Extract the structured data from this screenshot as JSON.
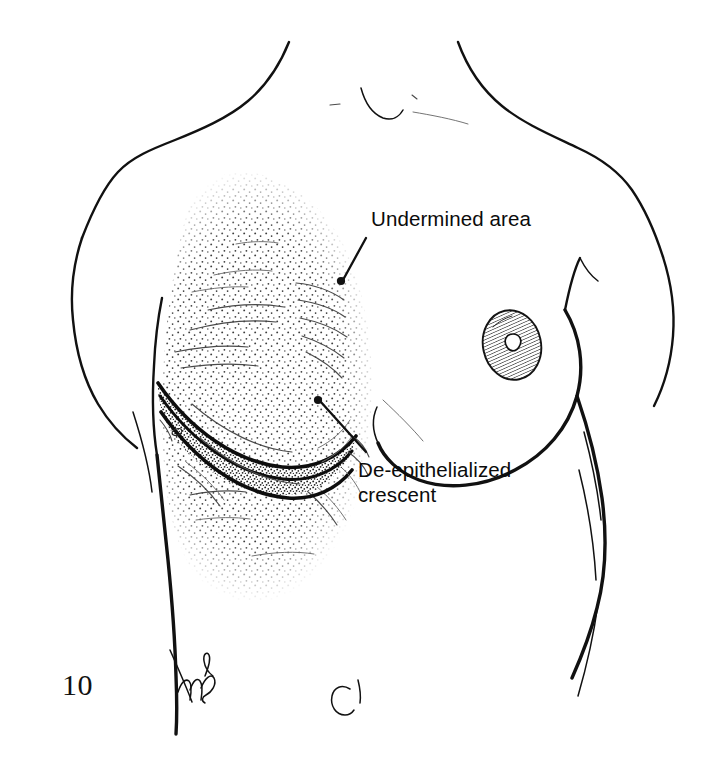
{
  "figure": {
    "number": "10",
    "panel_letter": "C",
    "artist_signature": "mL",
    "background_color": "#ffffff",
    "ink_color": "#111111"
  },
  "labels": {
    "undermined": {
      "text": "Undermined area",
      "leader_from": [
        366,
        215
      ],
      "leader_to": [
        341,
        281
      ]
    },
    "crescent": {
      "line1": "De-epithelialized",
      "line2": "crescent",
      "leader_from": [
        355,
        462
      ],
      "leader_to": [
        318,
        400
      ]
    }
  },
  "annotations": {
    "undermined_area": {
      "name": "Undermined area",
      "texture": "stipple",
      "stipple_color": "#3d3d3d"
    },
    "de_epithelialized_crescent": {
      "name": "De-epithelialized crescent",
      "texture": "dense-stipple",
      "edge_color": "#0d0d0d"
    },
    "areola": {
      "name": "Areola and nipple",
      "side": "patient-left",
      "texture": "hatched"
    }
  }
}
